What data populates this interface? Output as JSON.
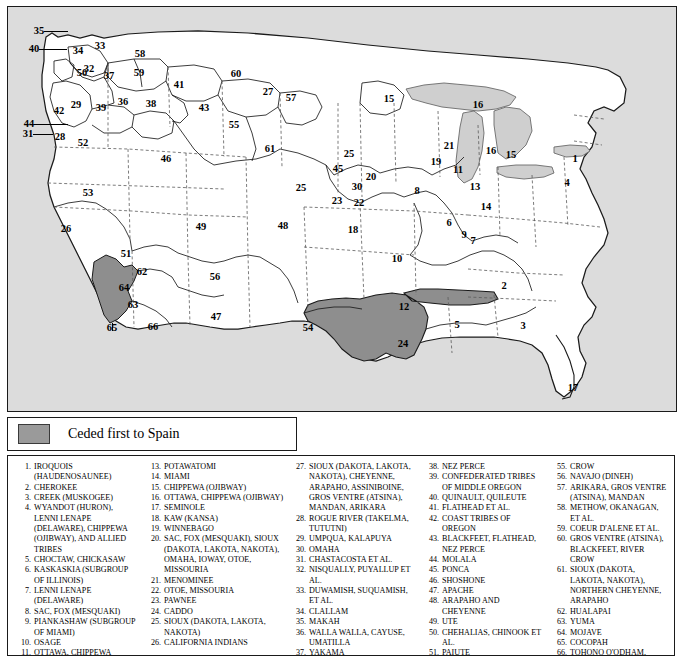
{
  "map": {
    "title": "Indian Land Cessions of the United States",
    "key": {
      "swatch_color": "#9a9a9a",
      "label": "Ceded first to Spain"
    },
    "colors": {
      "water": "#d0d0d0",
      "land": "#ffffff",
      "ceded_spain": "#8e8e8e",
      "border": "#1a1a1a",
      "state_line": "#555555"
    },
    "region_labels": [
      {
        "n": "35",
        "x": 31,
        "y": 24
      },
      {
        "n": "40",
        "x": 26,
        "y": 42
      },
      {
        "n": "34",
        "x": 70,
        "y": 44
      },
      {
        "n": "33",
        "x": 92,
        "y": 39
      },
      {
        "n": "32",
        "x": 81,
        "y": 62
      },
      {
        "n": "50",
        "x": 74,
        "y": 66
      },
      {
        "n": "58",
        "x": 132,
        "y": 47
      },
      {
        "n": "59",
        "x": 131,
        "y": 66
      },
      {
        "n": "37",
        "x": 101,
        "y": 69
      },
      {
        "n": "41",
        "x": 171,
        "y": 78
      },
      {
        "n": "60",
        "x": 228,
        "y": 67
      },
      {
        "n": "27",
        "x": 260,
        "y": 85
      },
      {
        "n": "57",
        "x": 283,
        "y": 91
      },
      {
        "n": "15",
        "x": 381,
        "y": 92
      },
      {
        "n": "16",
        "x": 470,
        "y": 98
      },
      {
        "n": "42",
        "x": 51,
        "y": 104
      },
      {
        "n": "29",
        "x": 68,
        "y": 98
      },
      {
        "n": "39",
        "x": 93,
        "y": 101
      },
      {
        "n": "36",
        "x": 115,
        "y": 95
      },
      {
        "n": "38",
        "x": 143,
        "y": 97
      },
      {
        "n": "43",
        "x": 196,
        "y": 101
      },
      {
        "n": "55",
        "x": 226,
        "y": 118
      },
      {
        "n": "21",
        "x": 441,
        "y": 139
      },
      {
        "n": "16",
        "x": 483,
        "y": 144
      },
      {
        "n": "15",
        "x": 503,
        "y": 148
      },
      {
        "n": "44",
        "x": 21,
        "y": 117
      },
      {
        "n": "31",
        "x": 20,
        "y": 127
      },
      {
        "n": "28",
        "x": 52,
        "y": 130
      },
      {
        "n": "52",
        "x": 75,
        "y": 136
      },
      {
        "n": "1",
        "x": 567,
        "y": 152
      },
      {
        "n": "61",
        "x": 262,
        "y": 142
      },
      {
        "n": "19",
        "x": 428,
        "y": 155
      },
      {
        "n": "11",
        "x": 450,
        "y": 163
      },
      {
        "n": "46",
        "x": 158,
        "y": 152
      },
      {
        "n": "45",
        "x": 330,
        "y": 162
      },
      {
        "n": "25",
        "x": 341,
        "y": 147
      },
      {
        "n": "20",
        "x": 363,
        "y": 170
      },
      {
        "n": "30",
        "x": 349,
        "y": 180
      },
      {
        "n": "22",
        "x": 351,
        "y": 196
      },
      {
        "n": "13",
        "x": 467,
        "y": 180
      },
      {
        "n": "14",
        "x": 478,
        "y": 200
      },
      {
        "n": "4",
        "x": 559,
        "y": 176
      },
      {
        "n": "53",
        "x": 80,
        "y": 186
      },
      {
        "n": "25",
        "x": 293,
        "y": 181
      },
      {
        "n": "23",
        "x": 329,
        "y": 194
      },
      {
        "n": "8",
        "x": 409,
        "y": 184
      },
      {
        "n": "6",
        "x": 441,
        "y": 216
      },
      {
        "n": "9",
        "x": 456,
        "y": 228
      },
      {
        "n": "7",
        "x": 465,
        "y": 234
      },
      {
        "n": "26",
        "x": 58,
        "y": 222
      },
      {
        "n": "49",
        "x": 193,
        "y": 220
      },
      {
        "n": "48",
        "x": 275,
        "y": 219
      },
      {
        "n": "18",
        "x": 345,
        "y": 223
      },
      {
        "n": "10",
        "x": 389,
        "y": 252
      },
      {
        "n": "51",
        "x": 118,
        "y": 247
      },
      {
        "n": "62",
        "x": 134,
        "y": 265
      },
      {
        "n": "64",
        "x": 116,
        "y": 281
      },
      {
        "n": "56",
        "x": 207,
        "y": 270
      },
      {
        "n": "2",
        "x": 496,
        "y": 279
      },
      {
        "n": "12",
        "x": 396,
        "y": 300
      },
      {
        "n": "63",
        "x": 125,
        "y": 298
      },
      {
        "n": "65",
        "x": 104,
        "y": 321
      },
      {
        "n": "66",
        "x": 145,
        "y": 320
      },
      {
        "n": "47",
        "x": 208,
        "y": 310
      },
      {
        "n": "54",
        "x": 300,
        "y": 321
      },
      {
        "n": "5",
        "x": 449,
        "y": 318
      },
      {
        "n": "3",
        "x": 515,
        "y": 319
      },
      {
        "n": "24",
        "x": 395,
        "y": 337
      },
      {
        "n": "17",
        "x": 565,
        "y": 381
      }
    ]
  },
  "legend": {
    "columns": [
      [
        {
          "num": "1.",
          "text": "IROQUOIS (HAUDENOSAUNEE)"
        },
        {
          "num": "2.",
          "text": "CHEROKEE"
        },
        {
          "num": "3.",
          "text": "CREEK (MUSKOGEE)"
        },
        {
          "num": "4.",
          "text": "WYANDOT (HURON), LENNI LENAPE (DELAWARE), CHIPPEWA (OJIBWAY), AND ALLIED TRIBES"
        },
        {
          "num": "5.",
          "text": "CHOCTAW, CHICKASAW"
        },
        {
          "num": "6.",
          "text": "KASKASKIA (SUBGROUP OF ILLINOIS)"
        },
        {
          "num": "7.",
          "text": "LENNI LENAPE (DELAWARE)"
        },
        {
          "num": "8.",
          "text": "SAC, FOX (MESQUAKI)"
        },
        {
          "num": "9.",
          "text": "PIANKASHAW (SUBGROUP OF MIAMI)"
        },
        {
          "num": "10.",
          "text": "OSAGE"
        },
        {
          "num": "11.",
          "text": "OTTAWA, CHIPPEWA (OJIBWAY), POTAWATOMI"
        },
        {
          "num": "12.",
          "text": "QUAPAW"
        }
      ],
      [
        {
          "num": "13.",
          "text": "POTAWATOMI"
        },
        {
          "num": "14.",
          "text": "MIAMI"
        },
        {
          "num": "15.",
          "text": "CHIPPEWA (OJIBWAY)"
        },
        {
          "num": "16.",
          "text": "OTTAWA, CHIPPEWA (OJIBWAY)"
        },
        {
          "num": "17.",
          "text": "SEMINOLE"
        },
        {
          "num": "18.",
          "text": "KAW (KANSA)"
        },
        {
          "num": "19.",
          "text": "WINNEBAGO"
        },
        {
          "num": "20.",
          "text": "SAC, FOX (MESQUAKI), SIOUX (DAKOTA, LAKOTA, NAKOTA), OMAHA, IOWAY, OTOE, MISSOURIA"
        },
        {
          "num": "21.",
          "text": "MENOMINEE"
        },
        {
          "num": "22.",
          "text": "OTOE, MISSOURIA"
        },
        {
          "num": "23.",
          "text": "PAWNEE"
        },
        {
          "num": "24.",
          "text": "CADDO"
        },
        {
          "num": "25.",
          "text": "SIOUX (DAKOTA, LAKOTA, NAKOTA)"
        },
        {
          "num": "26.",
          "text": "CALIFORNIA INDIANS"
        }
      ],
      [
        {
          "num": "27.",
          "text": "SIOUX (DAKOTA, LAKOTA, NAKOTA), CHEYENNE, ARAPAHO, ASSINIBOINE, GROS VENTRE (ATSINA), MANDAN, ARIKARA"
        },
        {
          "num": "28.",
          "text": "ROGUE RIVER (TAKELMA, TUTUTNI)"
        },
        {
          "num": "29.",
          "text": "UMPQUA, KALAPUYA"
        },
        {
          "num": "30.",
          "text": "OMAHA"
        },
        {
          "num": "31.",
          "text": "CHASTACOSTA ET AL."
        },
        {
          "num": "32.",
          "text": "NISQUALLY, PUYALLUP ET AL."
        },
        {
          "num": "33.",
          "text": "DUWAMISH, SUQUAMISH, ET AL."
        },
        {
          "num": "34.",
          "text": "CLALLAM"
        },
        {
          "num": "35.",
          "text": "MAKAH"
        },
        {
          "num": "36.",
          "text": "WALLA WALLA, CAYUSE, UMATILLA"
        },
        {
          "num": "37.",
          "text": "YAKAMA"
        }
      ],
      [
        {
          "num": "38.",
          "text": "NEZ PERCE"
        },
        {
          "num": "39.",
          "text": "CONFEDERATED TRIBES OF MIDDLE OREGON"
        },
        {
          "num": "40.",
          "text": "QUINAULT, QUILEUTE"
        },
        {
          "num": "41.",
          "text": "FLATHEAD ET AL."
        },
        {
          "num": "42.",
          "text": "COAST TRIBES OF OREGON"
        },
        {
          "num": "43.",
          "text": "BLACKFEET, FLATHEAD, NEZ PERCE"
        },
        {
          "num": "44.",
          "text": "MOLALA"
        },
        {
          "num": "45.",
          "text": "PONCA"
        },
        {
          "num": "46.",
          "text": "SHOSHONE"
        },
        {
          "num": "47.",
          "text": "APACHE"
        },
        {
          "num": "48.",
          "text": "ARAPAHO AND CHEYENNE"
        },
        {
          "num": "49.",
          "text": "UTE"
        },
        {
          "num": "50.",
          "text": "CHEHALIAS, CHINOOK ET AL."
        },
        {
          "num": "51.",
          "text": "PAIUTE"
        },
        {
          "num": "52.",
          "text": "KLAMATH ET AL."
        },
        {
          "num": "53.",
          "text": "WASHOE"
        },
        {
          "num": "54.",
          "text": "COMANCHE, KIOWA"
        }
      ],
      [
        {
          "num": "55.",
          "text": "CROW"
        },
        {
          "num": "56.",
          "text": "NAVAJO (DINEH)"
        },
        {
          "num": "57.",
          "text": "ARIKARA, GROS VENTRE (ATSINA), MANDAN"
        },
        {
          "num": "58.",
          "text": "METHOW, OKANAGAN, ET AL."
        },
        {
          "num": "59.",
          "text": "COEUR D'ALENE ET AL."
        },
        {
          "num": "60.",
          "text": "GROS VENTRE (ATSINA), BLACKFEET, RIVER CROW"
        },
        {
          "num": "61.",
          "text": "SIOUX (DAKOTA, LAKOTA, NAKOTA), NORTHERN CHEYENNE, ARAPAHO"
        },
        {
          "num": "62.",
          "text": "HUALAPAI"
        },
        {
          "num": "63.",
          "text": "YUMA"
        },
        {
          "num": "64.",
          "text": "MOJAVE"
        },
        {
          "num": "65.",
          "text": "COCOPAH"
        },
        {
          "num": "66.",
          "text": "TOHONO O'ODHAM, AKIMEL O'ODHAM, MARICOPA"
        }
      ]
    ]
  }
}
